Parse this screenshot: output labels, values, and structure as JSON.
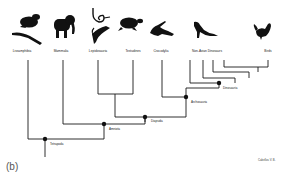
{
  "figure": {
    "panel_label": "(b)",
    "credit": "Cabellos V. B.",
    "taxa": [
      {
        "id": "lissamphibia",
        "label": "Lissamphibia",
        "icon": "frog-and-salamander-silhouette-icon"
      },
      {
        "id": "mammalia",
        "label": "Mammalia",
        "icon": "elephant-silhouette-icon"
      },
      {
        "id": "lepidosauria",
        "label": "Lepidosauria",
        "icon": "snake-and-lizard-silhouette-icon"
      },
      {
        "id": "testudines",
        "label": "Testudines",
        "icon": "turtle-silhouette-icon"
      },
      {
        "id": "crocodylia",
        "label": "Crocodylia",
        "icon": "crocodile-silhouette-icon"
      },
      {
        "id": "non-avian-dinosaurs",
        "label": "Non-Avian Dinosaurs",
        "icon": "theropod-dinosaur-silhouette-icon"
      },
      {
        "id": "birds",
        "label": "Birds",
        "icon": "rooster-silhouette-icon"
      }
    ],
    "nodes": [
      {
        "id": "tetrapoda",
        "label": "Tetrapoda"
      },
      {
        "id": "amniota",
        "label": "Amniota"
      },
      {
        "id": "diapsida",
        "label": "Diapsida"
      },
      {
        "id": "archosauria",
        "label": "Archosauria"
      },
      {
        "id": "dinosauria",
        "label": "Dinosauria"
      }
    ]
  }
}
